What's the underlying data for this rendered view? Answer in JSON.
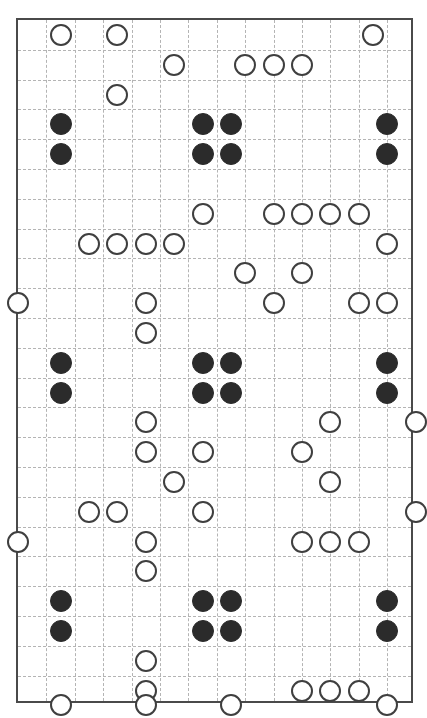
{
  "title": "",
  "board": {
    "columns": 14,
    "rows": 23,
    "cell_width": 28.4,
    "cell_height": 29.8,
    "origin_x": 16,
    "origin_y": 18,
    "border_color": "#4a4a4a",
    "gridline_color": "#b4b4b4",
    "gridline_style": "dashed",
    "background": "#ffffff"
  },
  "legend": {
    "hollow_label": "open marker",
    "filled_label": "solid marker",
    "hollow_color": "#ffffff",
    "hollow_outline": "#3f3f3f",
    "filled_color": "#2b2b2b"
  },
  "chart_data": {
    "type": "scatter",
    "title": "",
    "xlabel": "",
    "ylabel": "",
    "xlim": [
      0,
      14
    ],
    "ylim": [
      0,
      23
    ],
    "grid": true,
    "legend_position": "none",
    "note": "Markers are placed on grid-line intersections. Coordinates are (col,row) intersection indices; col 0..14 left-to-right, row 0..23 top-to-bottom.",
    "series": [
      {
        "name": "open marker",
        "marker": "circle-open",
        "color": "#ffffff",
        "outline": "#3f3f3f",
        "points": [
          [
            1.5,
            0.5
          ],
          [
            3.5,
            0.5
          ],
          [
            12.5,
            0.5
          ],
          [
            5.5,
            1.5
          ],
          [
            8.0,
            1.5
          ],
          [
            9.0,
            1.5
          ],
          [
            10.0,
            1.5
          ],
          [
            3.5,
            2.5
          ],
          [
            6.5,
            6.5
          ],
          [
            9.0,
            6.5
          ],
          [
            10.0,
            6.5
          ],
          [
            11.0,
            6.5
          ],
          [
            12.0,
            6.5
          ],
          [
            2.5,
            7.5
          ],
          [
            3.5,
            7.5
          ],
          [
            4.5,
            7.5
          ],
          [
            5.5,
            7.5
          ],
          [
            13.0,
            7.5
          ],
          [
            8.0,
            8.5
          ],
          [
            10.0,
            8.5
          ],
          [
            0.0,
            9.5
          ],
          [
            4.5,
            9.5
          ],
          [
            9.0,
            9.5
          ],
          [
            12.0,
            9.5
          ],
          [
            13.0,
            9.5
          ],
          [
            4.5,
            10.5
          ],
          [
            4.5,
            13.5
          ],
          [
            11.0,
            13.5
          ],
          [
            14.0,
            13.5
          ],
          [
            4.5,
            14.5
          ],
          [
            6.5,
            14.5
          ],
          [
            10.0,
            14.5
          ],
          [
            5.5,
            15.5
          ],
          [
            11.0,
            15.5
          ],
          [
            2.5,
            16.5
          ],
          [
            3.5,
            16.5
          ],
          [
            6.5,
            16.5
          ],
          [
            14.0,
            16.5
          ],
          [
            0.0,
            17.5
          ],
          [
            4.5,
            17.5
          ],
          [
            10.0,
            17.5
          ],
          [
            11.0,
            17.5
          ],
          [
            12.0,
            17.5
          ],
          [
            4.5,
            18.5
          ],
          [
            4.5,
            21.5
          ],
          [
            4.5,
            22.5
          ],
          [
            10.0,
            22.5
          ],
          [
            11.0,
            22.5
          ],
          [
            12.0,
            22.5
          ],
          [
            1.5,
            23.0
          ],
          [
            4.5,
            23.0
          ],
          [
            7.5,
            23.0
          ],
          [
            13.0,
            23.0
          ]
        ]
      },
      {
        "name": "solid marker",
        "marker": "circle-filled",
        "color": "#2b2b2b",
        "points": [
          [
            1.5,
            3.5
          ],
          [
            6.5,
            3.5
          ],
          [
            7.5,
            3.5
          ],
          [
            13.0,
            3.5
          ],
          [
            1.5,
            4.5
          ],
          [
            6.5,
            4.5
          ],
          [
            7.5,
            4.5
          ],
          [
            13.0,
            4.5
          ],
          [
            1.5,
            11.5
          ],
          [
            6.5,
            11.5
          ],
          [
            7.5,
            11.5
          ],
          [
            13.0,
            11.5
          ],
          [
            1.5,
            12.5
          ],
          [
            6.5,
            12.5
          ],
          [
            7.5,
            12.5
          ],
          [
            13.0,
            12.5
          ],
          [
            1.5,
            19.5
          ],
          [
            6.5,
            19.5
          ],
          [
            7.5,
            19.5
          ],
          [
            13.0,
            19.5
          ],
          [
            1.5,
            20.5
          ],
          [
            6.5,
            20.5
          ],
          [
            7.5,
            20.5
          ],
          [
            13.0,
            20.5
          ]
        ]
      }
    ]
  }
}
